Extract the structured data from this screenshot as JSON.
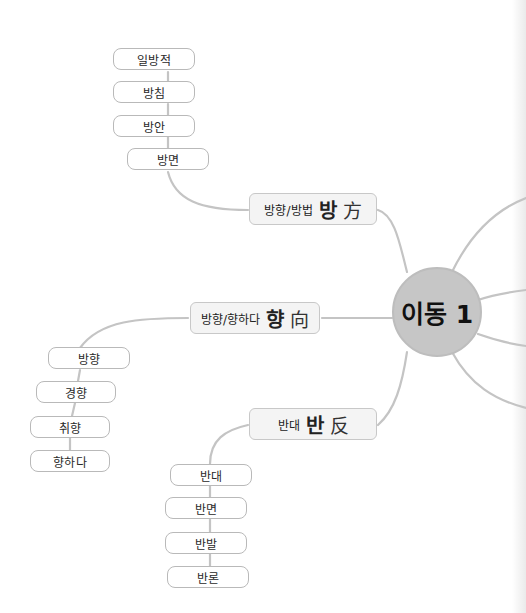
{
  "center": {
    "label": "이동 1"
  },
  "colors": {
    "line": "#c4c4c4",
    "center_fill": "#c6c6c6",
    "branch_fill": "#f4f4f4",
    "leaf_border": "#b9b9b9"
  },
  "branches": [
    {
      "sub": "방향/방법",
      "korean": "방",
      "hanja": "方",
      "leaves": [
        "일방적",
        "방침",
        "방안",
        "방면"
      ]
    },
    {
      "sub": "방향/향하다",
      "korean": "향",
      "hanja": "向",
      "leaves": [
        "방향",
        "경향",
        "취향",
        "향하다"
      ]
    },
    {
      "sub": "반대",
      "korean": "반",
      "hanja": "反",
      "leaves": [
        "반대",
        "반면",
        "반발",
        "반론"
      ]
    }
  ]
}
